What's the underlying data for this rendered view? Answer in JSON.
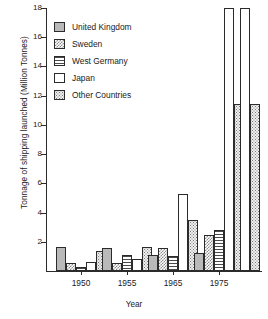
{
  "chart_data": {
    "type": "bar",
    "title": "",
    "xlabel": "Year",
    "ylabel": "Tonnage of shipping launched (Million Tonnes)",
    "ylim": [
      0,
      18
    ],
    "yticks": [
      0,
      2,
      4,
      6,
      8,
      10,
      12,
      14,
      16,
      18
    ],
    "ytick_labels": [
      "",
      "2",
      "4",
      "6",
      "8",
      "10",
      "12",
      "14",
      "16",
      "18"
    ],
    "grid": false,
    "legend_position": "upper-left-inside",
    "categories": [
      "1950",
      "1955",
      "1965",
      "1975",
      ""
    ],
    "xtick_labels": [
      "1950",
      "1955",
      "1965",
      "1975"
    ],
    "series": [
      {
        "name": "United Kingdom",
        "pattern": "solid-grey",
        "values": [
          1.65,
          1.55,
          1.1,
          1.2,
          0.0
        ]
      },
      {
        "name": "Sweden",
        "pattern": "checkerboard",
        "values": [
          0.55,
          0.55,
          1.55,
          2.45,
          0.0
        ]
      },
      {
        "name": "West Germany",
        "pattern": "horizontal-lines",
        "values": [
          0.3,
          1.1,
          1.05,
          2.8,
          0.0
        ]
      },
      {
        "name": "Japan",
        "pattern": "white",
        "values": [
          0.6,
          0.8,
          5.25,
          18.0,
          18.0
        ]
      },
      {
        "name": "Other Countries",
        "pattern": "stipple-dots",
        "values": [
          1.4,
          1.62,
          3.5,
          11.45,
          11.45
        ]
      }
    ]
  },
  "legend": {
    "items": [
      {
        "label": "United Kingdom",
        "swatch": "solid-grey"
      },
      {
        "label": "Sweden",
        "swatch": "checkerboard"
      },
      {
        "label": "West Germany",
        "swatch": "horizontal-lines"
      },
      {
        "label": "Japan",
        "swatch": "white"
      },
      {
        "label": "Other Countries",
        "swatch": "stipple-dots"
      }
    ]
  },
  "colors": {
    "axis": "#2b2b2b",
    "solid_grey": "#b9b9b9",
    "pattern_grey": "#8d8d8d",
    "background": "#ffffff"
  }
}
